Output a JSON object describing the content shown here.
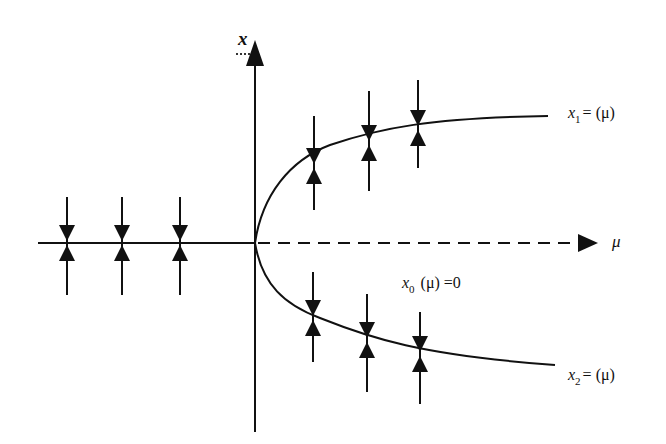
{
  "diagram": {
    "axes": {
      "vertical_label": "x",
      "horizontal_label": "μ",
      "origin": [
        255,
        243
      ]
    },
    "labels": {
      "upper_branch": {
        "var": "x",
        "sub": "1",
        "rest": "= (μ)"
      },
      "lower_branch": {
        "var": "x",
        "sub": "2",
        "rest": "= (μ)"
      },
      "trivial_branch": {
        "var": "x",
        "sub": "0",
        "rest": " (μ) =0"
      }
    },
    "branches": [
      {
        "name": "x0 (mu<0) stable",
        "style": "solid"
      },
      {
        "name": "x0 (mu>0) unstable",
        "style": "dashed"
      },
      {
        "name": "x1 upper stable",
        "style": "solid"
      },
      {
        "name": "x2 lower stable",
        "style": "solid"
      }
    ],
    "stability_markers": {
      "left_x0": [
        67,
        122,
        180
      ],
      "upper_x1": [
        314,
        369,
        418
      ],
      "lower_x2": [
        313,
        367,
        420
      ]
    },
    "colors": {
      "ink": "#111111",
      "background": "#ffffff"
    }
  }
}
